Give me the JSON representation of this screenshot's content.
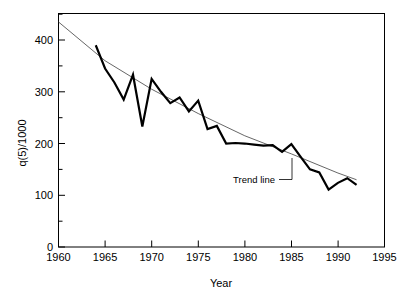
{
  "chart_data": {
    "type": "line",
    "title": "",
    "xlabel": "Year",
    "ylabel": "q(5)/1000",
    "xlim": [
      1960,
      1995
    ],
    "ylim": [
      0,
      450
    ],
    "grid": false,
    "legend": false,
    "xticks": [
      1960,
      1965,
      1970,
      1975,
      1980,
      1985,
      1990,
      1995
    ],
    "xtick_labels": [
      "1960",
      "1965",
      "1970",
      "1975",
      "1980",
      "1985",
      "1990",
      "1995"
    ],
    "yticks": [
      0,
      100,
      200,
      300,
      400
    ],
    "ytick_labels": [
      "0",
      "100",
      "200",
      "300",
      "400"
    ],
    "yticks_minor": [
      50,
      150,
      250,
      350,
      450
    ],
    "annotations": [
      {
        "text": "Trend line",
        "x": 1981.0,
        "y": 143
      }
    ],
    "series": [
      {
        "name": "q(5)/1000 observed",
        "style": "thick-black-line",
        "color": "#000000",
        "x": [
          1964,
          1965,
          1966,
          1967,
          1968,
          1969,
          1970,
          1971,
          1972,
          1973,
          1974,
          1975,
          1976,
          1977,
          1978,
          1979,
          1980,
          1981,
          1982,
          1983,
          1984,
          1985,
          1986,
          1987,
          1988,
          1989,
          1990,
          1991,
          1992
        ],
        "values": [
          390,
          345,
          318,
          285,
          333,
          233,
          325,
          300,
          278,
          289,
          262,
          283,
          228,
          234,
          200,
          201,
          200,
          198,
          196,
          197,
          184,
          199,
          174,
          150,
          144,
          111,
          124,
          133,
          120
        ]
      },
      {
        "name": "Trend line",
        "style": "thin-gray-line",
        "color": "#555555",
        "x": [
          1960,
          1965,
          1970,
          1975,
          1980,
          1985,
          1990,
          1992
        ],
        "values": [
          435,
          360,
          305,
          258,
          215,
          180,
          143,
          130
        ]
      }
    ]
  },
  "axes": {
    "y_axis_title": "q(5)/1000",
    "x_axis_title": "Year"
  },
  "icons": {
    "leader": "leader-line"
  }
}
